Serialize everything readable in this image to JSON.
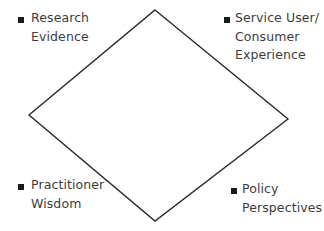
{
  "diagram": {
    "type": "diamond",
    "stroke_color": "#2a2a2a",
    "background": "#ffffff",
    "vertices": {
      "top": [
        155,
        10
      ],
      "right": [
        288,
        119
      ],
      "bottom": [
        155,
        221
      ],
      "left": [
        29,
        115
      ]
    },
    "labels": [
      {
        "id": "research-evidence",
        "position": "top-left",
        "lines": [
          "Research",
          "Evidence"
        ]
      },
      {
        "id": "service-user-consumer-experience",
        "position": "top-right",
        "lines": [
          "Service User/",
          "Consumer",
          "Experience"
        ]
      },
      {
        "id": "practitioner-wisdom",
        "position": "bottom-left",
        "lines": [
          "Practitioner",
          "Wisdom"
        ]
      },
      {
        "id": "policy-perspectives",
        "position": "bottom-right",
        "lines": [
          "Policy",
          "Perspectives"
        ]
      }
    ]
  }
}
